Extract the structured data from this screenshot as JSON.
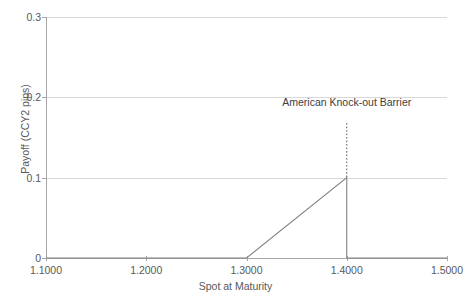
{
  "chart_data": {
    "type": "line",
    "title": "",
    "xlabel": "Spot at Maturity",
    "ylabel": "Payoff (CCY2 pips)",
    "xlim": [
      1.1,
      1.5
    ],
    "ylim": [
      0,
      0.3
    ],
    "xticks": [
      "1.1000",
      "1.2000",
      "1.3000",
      "1.4000",
      "1.5000"
    ],
    "xtick_values": [
      1.1,
      1.2,
      1.3,
      1.4,
      1.5
    ],
    "yticks": [
      "0",
      "0.1",
      "0.2",
      "0.3"
    ],
    "ytick_values": [
      0,
      0.1,
      0.2,
      0.3
    ],
    "grid": true,
    "legend": "none",
    "series": [
      {
        "name": "Payoff",
        "color": "#808080",
        "x": [
          1.1,
          1.3,
          1.4,
          1.4,
          1.5
        ],
        "values": [
          0,
          0,
          0.1,
          0,
          0
        ]
      }
    ],
    "annotations": [
      {
        "name": "american-knock-out-barrier",
        "label": "American Knock-out Barrier",
        "x": 1.4,
        "line_style": "dotted",
        "line_color": "#595959",
        "line_y_from": 0.168,
        "line_y_to": 0.1,
        "label_y": 0.193
      }
    ]
  }
}
